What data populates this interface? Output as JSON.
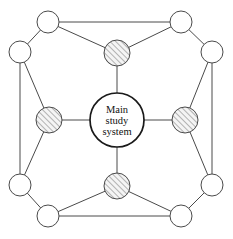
{
  "diagram": {
    "center_node": {
      "name": "main-study-system",
      "label_lines": [
        "Main",
        "study",
        "system"
      ],
      "cx": 117,
      "cy": 120,
      "r": 27,
      "fill": "#ffffff",
      "stroke": "#1a1a1a"
    },
    "style": {
      "edge_color": "#4a4a4a",
      "node_stroke": "#4a4a4a",
      "plain_fill": "#ffffff",
      "hatch_color": "#6e6e6e",
      "hatch_fill": "#f2f2f2",
      "background": "#ffffff"
    },
    "hatched_nodes": [
      {
        "name": "subsystem-north",
        "cx": 117,
        "cy": 53,
        "r": 13
      },
      {
        "name": "subsystem-east",
        "cx": 185,
        "cy": 120,
        "r": 13
      },
      {
        "name": "subsystem-south",
        "cx": 117,
        "cy": 186,
        "r": 13
      },
      {
        "name": "subsystem-west",
        "cx": 49,
        "cy": 120,
        "r": 13
      }
    ],
    "plain_nodes": [
      {
        "name": "peripheral-top-left",
        "cx": 48,
        "cy": 22,
        "r": 11
      },
      {
        "name": "peripheral-top-right",
        "cx": 181,
        "cy": 22,
        "r": 11
      },
      {
        "name": "peripheral-right-top",
        "cx": 212,
        "cy": 52,
        "r": 11
      },
      {
        "name": "peripheral-right-bottom",
        "cx": 212,
        "cy": 185,
        "r": 11
      },
      {
        "name": "peripheral-bottom-right",
        "cx": 181,
        "cy": 216,
        "r": 11
      },
      {
        "name": "peripheral-bottom-left",
        "cx": 48,
        "cy": 216,
        "r": 11
      },
      {
        "name": "peripheral-left-bottom",
        "cx": 20,
        "cy": 185,
        "r": 11
      },
      {
        "name": "peripheral-left-top",
        "cx": 20,
        "cy": 52,
        "r": 11
      }
    ],
    "edges": [
      {
        "name": "edge-center-north",
        "x1": 117,
        "y1": 120,
        "x2": 117,
        "y2": 53
      },
      {
        "name": "edge-center-east",
        "x1": 117,
        "y1": 120,
        "x2": 185,
        "y2": 120
      },
      {
        "name": "edge-center-south",
        "x1": 117,
        "y1": 120,
        "x2": 117,
        "y2": 186
      },
      {
        "name": "edge-center-west",
        "x1": 117,
        "y1": 120,
        "x2": 49,
        "y2": 120
      },
      {
        "name": "edge-north-topleft",
        "x1": 117,
        "y1": 53,
        "x2": 48,
        "y2": 22
      },
      {
        "name": "edge-north-topright",
        "x1": 117,
        "y1": 53,
        "x2": 181,
        "y2": 22
      },
      {
        "name": "edge-east-righttop",
        "x1": 185,
        "y1": 120,
        "x2": 212,
        "y2": 52
      },
      {
        "name": "edge-east-rightbottom",
        "x1": 185,
        "y1": 120,
        "x2": 212,
        "y2": 185
      },
      {
        "name": "edge-south-bottomleft",
        "x1": 117,
        "y1": 186,
        "x2": 48,
        "y2": 216
      },
      {
        "name": "edge-south-bottomright",
        "x1": 117,
        "y1": 186,
        "x2": 181,
        "y2": 216
      },
      {
        "name": "edge-west-lefttop",
        "x1": 49,
        "y1": 120,
        "x2": 20,
        "y2": 52
      },
      {
        "name": "edge-west-leftbottom",
        "x1": 49,
        "y1": 120,
        "x2": 20,
        "y2": 185
      },
      {
        "name": "edge-top-span",
        "x1": 48,
        "y1": 22,
        "x2": 181,
        "y2": 22
      },
      {
        "name": "edge-right-span",
        "x1": 212,
        "y1": 52,
        "x2": 212,
        "y2": 185
      },
      {
        "name": "edge-bottom-span",
        "x1": 48,
        "y1": 216,
        "x2": 181,
        "y2": 216
      },
      {
        "name": "edge-left-span",
        "x1": 20,
        "y1": 52,
        "x2": 20,
        "y2": 185
      },
      {
        "name": "edge-corner-topleft",
        "x1": 48,
        "y1": 22,
        "x2": 20,
        "y2": 52
      },
      {
        "name": "edge-corner-topright",
        "x1": 181,
        "y1": 22,
        "x2": 212,
        "y2": 52
      },
      {
        "name": "edge-corner-bottomright",
        "x1": 181,
        "y1": 216,
        "x2": 212,
        "y2": 185
      },
      {
        "name": "edge-corner-bottomleft",
        "x1": 48,
        "y1": 216,
        "x2": 20,
        "y2": 185
      }
    ]
  }
}
